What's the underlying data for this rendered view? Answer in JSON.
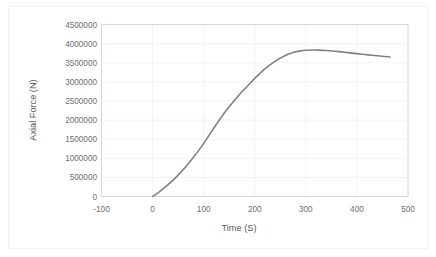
{
  "chart_data": {
    "type": "line",
    "title": "",
    "subtitle": "",
    "xlabel": "Time (S)",
    "ylabel": "Axial Force (N)",
    "xlim": [
      -100,
      500
    ],
    "ylim": [
      0,
      4500000
    ],
    "xticks": [
      "-100",
      "0",
      "100",
      "200",
      "300",
      "400",
      "500"
    ],
    "xtick_values": [
      -100,
      0,
      100,
      200,
      300,
      400,
      500
    ],
    "yticks": [
      "0",
      "500000",
      "1000000",
      "1500000",
      "2000000",
      "2500000",
      "3000000",
      "3500000",
      "4000000",
      "4500000"
    ],
    "ytick_values": [
      0,
      500000,
      1000000,
      1500000,
      2000000,
      2500000,
      3000000,
      3500000,
      4000000,
      4500000
    ],
    "grid": true,
    "grid_axis": "both",
    "legend": false,
    "legend_position": "none",
    "series": [
      {
        "name": "Axial Force",
        "color": "#808080",
        "line_width": 1.6,
        "markers": false,
        "x": [
          0,
          10,
          25,
          40,
          50,
          65,
          75,
          90,
          100,
          115,
          125,
          140,
          150,
          165,
          175,
          190,
          200,
          215,
          225,
          240,
          250,
          265,
          275,
          290,
          300,
          315,
          325,
          340,
          350,
          365,
          375,
          390,
          400,
          415,
          430,
          445,
          465
        ],
        "y": [
          0,
          90000,
          250000,
          430000,
          560000,
          780000,
          940000,
          1200000,
          1390000,
          1690000,
          1890000,
          2180000,
          2350000,
          2590000,
          2740000,
          2950000,
          3090000,
          3280000,
          3390000,
          3540000,
          3620000,
          3720000,
          3770000,
          3810000,
          3825000,
          3832000,
          3830000,
          3820000,
          3808000,
          3790000,
          3776000,
          3752000,
          3738000,
          3715000,
          3695000,
          3675000,
          3650000
        ]
      }
    ]
  },
  "plot": {
    "x_axis_name": "x-axis",
    "y_axis_name": "y-axis",
    "series_name": "axial-force-curve"
  }
}
